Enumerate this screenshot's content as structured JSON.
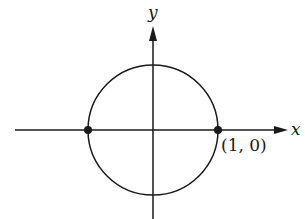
{
  "diagram": {
    "type": "unit-circle",
    "axes": {
      "x_label": "x",
      "y_label": "y"
    },
    "points": [
      {
        "name": "left-intersection",
        "coords": [
          -1,
          0
        ],
        "label": ""
      },
      {
        "name": "right-intersection",
        "coords": [
          1,
          0
        ],
        "label": "(1, 0)"
      }
    ],
    "colors": {
      "stroke": "#1a1a1a",
      "background": "#ffffff"
    }
  }
}
